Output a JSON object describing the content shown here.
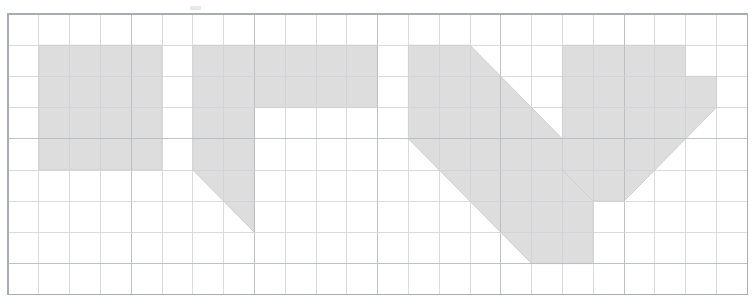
{
  "page": {
    "background_color": "#ffffff",
    "width": 755,
    "height": 308
  },
  "grid": {
    "name": "graph-paper-grid",
    "origin_x": 8,
    "origin_y": 14,
    "cell_width": 30.8,
    "cell_height": 31.2,
    "columns": 24,
    "rows": 9,
    "line_color": "#b9bcc0",
    "minor_line_color": "#cfd2d6",
    "border_color": "#a9acb1"
  },
  "artwork": {
    "name": "shaded-glyph-composition",
    "fill_color": "#dddddd",
    "outline_color": "#c9c9c9",
    "description": "Four shaded glyph forms laid out across a 24 by 9 square grid",
    "glyphs": [
      {
        "id": "glyph-1",
        "label": "solid-block",
        "kind": "rectangle",
        "grid_col_start": 1,
        "grid_col_end": 5,
        "grid_row_start": 1,
        "grid_row_end": 5,
        "points": "1,1 5,1 5,5 1,5"
      },
      {
        "id": "glyph-2",
        "label": "gamma-with-diagonal-tail",
        "kind": "polygon",
        "grid_col_start": 6,
        "grid_col_end": 12,
        "grid_row_start": 1,
        "grid_row_end": 7,
        "points": "6,1 12,1 12,3 8,3 8,7 6,5"
      },
      {
        "id": "glyph-3",
        "label": "diagonal-band",
        "kind": "polygon",
        "grid_col_start": 13,
        "grid_col_end": 18,
        "grid_row_start": 1,
        "grid_row_end": 8,
        "points": "13,1 15,1 19,5 19,8 17,8 13,4"
      },
      {
        "id": "glyph-4",
        "label": "vee",
        "kind": "polygon",
        "grid_col_start": 18,
        "grid_col_end": 23,
        "grid_row_start": 1,
        "grid_row_end": 6,
        "points": "18,1 22,1 22,2 23,2 23,3 20,6 19,6 18,5"
      }
    ],
    "specks": [
      {
        "id": "speck-top",
        "x": 190,
        "y": 6,
        "w": 11,
        "h": 4
      }
    ]
  }
}
